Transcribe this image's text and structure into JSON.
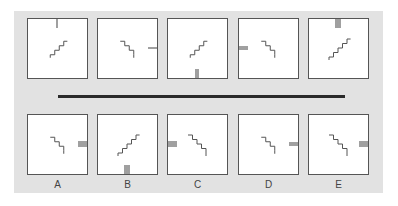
{
  "puzzle": {
    "type": "visual-analogy-series",
    "colors": {
      "panel": "#e2e2e2",
      "box_border": "#555555",
      "stairs": "#555555",
      "bar": "#777777",
      "separator": "#2a2a2a"
    },
    "question_figures": [
      {
        "stairs": "ascending-right",
        "bar": {
          "position": "top-center",
          "lines": 1,
          "orientation": "vertical"
        }
      },
      {
        "stairs": "descending-right",
        "bar": {
          "position": "right-middle",
          "lines": 1,
          "orientation": "horizontal"
        }
      },
      {
        "stairs": "ascending-right",
        "bar": {
          "position": "bottom-center",
          "lines": 2,
          "orientation": "vertical"
        }
      },
      {
        "stairs": "descending-right",
        "bar": {
          "position": "left-middle",
          "lines": 2,
          "orientation": "horizontal"
        }
      },
      {
        "stairs": "ascending-right-long",
        "bar": {
          "position": "top-center",
          "lines": 3,
          "orientation": "vertical"
        }
      }
    ],
    "answer_options": [
      {
        "label": "A",
        "stairs": "descending-right",
        "bar": {
          "position": "right-middle",
          "lines": 3,
          "orientation": "horizontal"
        }
      },
      {
        "label": "B",
        "stairs": "ascending-right-long",
        "bar": {
          "position": "bottom-center",
          "lines": 3,
          "orientation": "vertical"
        }
      },
      {
        "label": "C",
        "stairs": "descending-right-long",
        "bar": {
          "position": "left-middle",
          "lines": 3,
          "orientation": "horizontal"
        }
      },
      {
        "label": "D",
        "stairs": "descending-right",
        "bar": {
          "position": "right-middle",
          "lines": 2,
          "orientation": "horizontal"
        }
      },
      {
        "label": "E",
        "stairs": "descending-right-long",
        "bar": {
          "position": "right-middle",
          "lines": 3,
          "orientation": "horizontal"
        }
      }
    ]
  }
}
